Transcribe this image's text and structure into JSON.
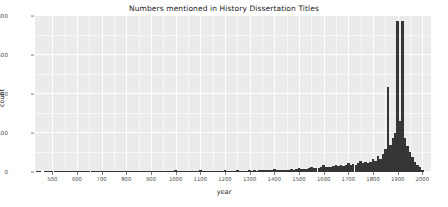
{
  "chart_data": {
    "type": "bar",
    "title": "Numbers mentioned in History Dissertation Titles",
    "xlabel": "year",
    "ylabel": "count",
    "xlim": [
      430,
      2035
    ],
    "ylim": [
      0,
      2000
    ],
    "grid": true,
    "legend": null,
    "bin_width": 10,
    "bar_color": "#363636",
    "panel_color": "#ebebeb",
    "gridline_color": "#ffffff",
    "x_ticks": [
      500,
      600,
      700,
      800,
      900,
      1000,
      1100,
      1200,
      1300,
      1400,
      1500,
      1600,
      1700,
      1800,
      1900,
      2000
    ],
    "x_tick_labels": [
      "500",
      "600",
      "700",
      "800",
      "900",
      "1000",
      "1100",
      "1200",
      "1300",
      "1400",
      "1500",
      "1600",
      "1700",
      "1800",
      "1900",
      "2000"
    ],
    "y_ticks": [
      0,
      500,
      1000,
      1500,
      2000
    ],
    "y_tick_labels": [
      "0",
      "500",
      "1000",
      "1500",
      "2000"
    ],
    "x_minor_ticks": [
      550,
      650,
      750,
      850,
      950,
      1050,
      1150,
      1250,
      1350,
      1450,
      1550,
      1650,
      1750,
      1850,
      1950
    ],
    "y_minor_ticks": [
      250,
      750,
      1250,
      1750
    ],
    "x": [
      440,
      450,
      460,
      470,
      480,
      490,
      500,
      510,
      520,
      530,
      540,
      550,
      560,
      570,
      580,
      590,
      600,
      610,
      620,
      630,
      640,
      650,
      660,
      670,
      680,
      690,
      700,
      710,
      720,
      730,
      740,
      750,
      760,
      770,
      780,
      790,
      800,
      810,
      820,
      830,
      840,
      850,
      860,
      870,
      880,
      890,
      900,
      910,
      920,
      930,
      940,
      950,
      960,
      970,
      980,
      990,
      1000,
      1010,
      1020,
      1030,
      1040,
      1050,
      1060,
      1070,
      1080,
      1090,
      1100,
      1110,
      1120,
      1130,
      1140,
      1150,
      1160,
      1170,
      1180,
      1190,
      1200,
      1210,
      1220,
      1230,
      1240,
      1250,
      1260,
      1270,
      1280,
      1290,
      1300,
      1310,
      1320,
      1330,
      1340,
      1350,
      1360,
      1370,
      1380,
      1390,
      1400,
      1410,
      1420,
      1430,
      1440,
      1450,
      1460,
      1470,
      1480,
      1490,
      1500,
      1510,
      1520,
      1530,
      1540,
      1550,
      1560,
      1570,
      1580,
      1590,
      1600,
      1610,
      1620,
      1630,
      1640,
      1650,
      1660,
      1670,
      1680,
      1690,
      1700,
      1710,
      1720,
      1730,
      1740,
      1750,
      1760,
      1770,
      1780,
      1790,
      1800,
      1810,
      1820,
      1830,
      1840,
      1850,
      1860,
      1870,
      1880,
      1890,
      1900,
      1910,
      1920,
      1930,
      1940,
      1950,
      1960,
      1970,
      1980,
      1990,
      2000
    ],
    "values": [
      2,
      1,
      0,
      2,
      1,
      12,
      3,
      1,
      2,
      1,
      4,
      2,
      1,
      3,
      2,
      1,
      14,
      2,
      1,
      3,
      2,
      4,
      1,
      2,
      1,
      3,
      13,
      2,
      1,
      2,
      3,
      5,
      1,
      2,
      2,
      1,
      14,
      2,
      3,
      1,
      2,
      6,
      2,
      1,
      3,
      2,
      14,
      2,
      1,
      3,
      2,
      7,
      2,
      3,
      2,
      4,
      22,
      6,
      4,
      5,
      6,
      12,
      5,
      6,
      4,
      7,
      20,
      6,
      8,
      7,
      9,
      14,
      8,
      10,
      9,
      12,
      26,
      12,
      14,
      11,
      15,
      20,
      16,
      14,
      18,
      16,
      30,
      18,
      20,
      17,
      22,
      26,
      20,
      24,
      22,
      26,
      34,
      24,
      28,
      26,
      30,
      32,
      30,
      34,
      32,
      36,
      52,
      38,
      42,
      40,
      46,
      60,
      48,
      55,
      52,
      58,
      86,
      62,
      70,
      64,
      72,
      96,
      74,
      85,
      78,
      88,
      120,
      92,
      104,
      96,
      110,
      135,
      112,
      126,
      118,
      132,
      170,
      140,
      200,
      168,
      230,
      290,
      1090,
      340,
      430,
      500,
      1940,
      660,
      1940,
      430,
      330,
      260,
      190,
      130,
      95,
      60,
      20
    ],
    "annotations": [
      {
        "x": 1860,
        "label": "spike",
        "value": 1090
      },
      {
        "x": 1900,
        "label": "spike",
        "value": 1940
      },
      {
        "x": 1920,
        "label": "spike",
        "value": 1940
      }
    ]
  }
}
